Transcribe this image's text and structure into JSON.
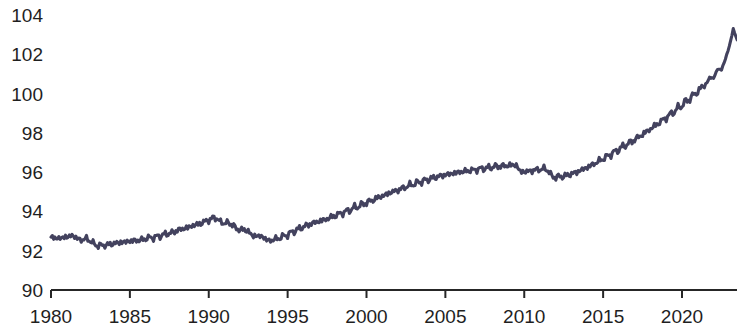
{
  "chart_data": {
    "type": "line",
    "title": "",
    "subtitle": "",
    "xlabel": "",
    "ylabel": "",
    "xlim": [
      1980,
      2023.5
    ],
    "ylim": [
      90,
      104
    ],
    "grid": false,
    "legend": false,
    "legend_position": "none",
    "xticks": [
      1980,
      1985,
      1990,
      1995,
      2000,
      2005,
      2010,
      2015,
      2020
    ],
    "xtick_labels": [
      "1980",
      "1985",
      "1990",
      "1995",
      "2000",
      "2005",
      "2010",
      "2015",
      "2020"
    ],
    "yticks": [
      90,
      92,
      94,
      96,
      98,
      100,
      102,
      104
    ],
    "ytick_labels": [
      "90",
      "92",
      "94",
      "96",
      "98",
      "100",
      "102",
      "104"
    ],
    "line_color": "#43425e",
    "axis_color": "#262626",
    "background_color": "#ffffff",
    "series": [
      {
        "name": "index",
        "x": [
          1980.0,
          1980.25,
          1980.5,
          1980.75,
          1981.0,
          1981.25,
          1981.5,
          1981.75,
          1982.0,
          1982.25,
          1982.5,
          1982.75,
          1983.0,
          1983.25,
          1983.5,
          1983.75,
          1984.0,
          1984.25,
          1984.5,
          1984.75,
          1985.0,
          1985.25,
          1985.5,
          1985.75,
          1986.0,
          1986.25,
          1986.5,
          1986.75,
          1987.0,
          1987.25,
          1987.5,
          1987.75,
          1988.0,
          1988.25,
          1988.5,
          1988.75,
          1989.0,
          1989.25,
          1989.5,
          1989.75,
          1990.0,
          1990.25,
          1990.5,
          1990.75,
          1991.0,
          1991.25,
          1991.5,
          1991.75,
          1992.0,
          1992.25,
          1992.5,
          1992.75,
          1993.0,
          1993.25,
          1993.5,
          1993.75,
          1994.0,
          1994.25,
          1994.5,
          1994.75,
          1995.0,
          1995.25,
          1995.5,
          1995.75,
          1996.0,
          1996.25,
          1996.5,
          1996.75,
          1997.0,
          1997.25,
          1997.5,
          1997.75,
          1998.0,
          1998.25,
          1998.5,
          1998.75,
          1999.0,
          1999.25,
          1999.5,
          1999.75,
          2000.0,
          2000.25,
          2000.5,
          2000.75,
          2001.0,
          2001.25,
          2001.5,
          2001.75,
          2002.0,
          2002.25,
          2002.5,
          2002.75,
          2003.0,
          2003.25,
          2003.5,
          2003.75,
          2004.0,
          2004.25,
          2004.5,
          2004.75,
          2005.0,
          2005.25,
          2005.5,
          2005.75,
          2006.0,
          2006.25,
          2006.5,
          2006.75,
          2007.0,
          2007.25,
          2007.5,
          2007.75,
          2008.0,
          2008.25,
          2008.5,
          2008.75,
          2009.0,
          2009.25,
          2009.5,
          2009.75,
          2010.0,
          2010.25,
          2010.5,
          2010.75,
          2011.0,
          2011.25,
          2011.5,
          2011.75,
          2012.0,
          2012.25,
          2012.5,
          2012.75,
          2013.0,
          2013.25,
          2013.5,
          2013.75,
          2014.0,
          2014.25,
          2014.5,
          2014.75,
          2015.0,
          2015.25,
          2015.5,
          2015.75,
          2016.0,
          2016.25,
          2016.5,
          2016.75,
          2017.0,
          2017.25,
          2017.5,
          2017.75,
          2018.0,
          2018.25,
          2018.5,
          2018.75,
          2019.0,
          2019.25,
          2019.5,
          2019.75,
          2020.0,
          2020.25,
          2020.5,
          2020.75,
          2021.0,
          2021.25,
          2021.5,
          2021.75,
          2022.0,
          2022.25,
          2022.5,
          2022.75,
          2023.0,
          2023.25,
          2023.5
        ],
        "values": [
          92.62,
          92.7,
          92.58,
          92.72,
          92.66,
          92.8,
          92.7,
          92.6,
          92.52,
          92.66,
          92.44,
          92.38,
          92.2,
          92.34,
          92.22,
          92.4,
          92.3,
          92.48,
          92.36,
          92.52,
          92.42,
          92.58,
          92.46,
          92.62,
          92.54,
          92.74,
          92.6,
          92.8,
          92.7,
          92.92,
          92.8,
          93.02,
          92.96,
          93.18,
          93.06,
          93.28,
          93.2,
          93.42,
          93.3,
          93.58,
          93.48,
          93.74,
          93.6,
          93.5,
          93.36,
          93.46,
          93.28,
          93.16,
          93.02,
          93.12,
          92.94,
          92.82,
          92.7,
          92.8,
          92.62,
          92.56,
          92.48,
          92.66,
          92.58,
          92.82,
          92.74,
          93.02,
          92.94,
          93.22,
          93.12,
          93.4,
          93.28,
          93.54,
          93.4,
          93.66,
          93.52,
          93.8,
          93.68,
          93.96,
          93.84,
          94.12,
          94.0,
          94.3,
          94.16,
          94.46,
          94.34,
          94.64,
          94.5,
          94.82,
          94.68,
          94.96,
          94.86,
          95.12,
          95.0,
          95.26,
          95.16,
          95.42,
          95.3,
          95.56,
          95.44,
          95.68,
          95.56,
          95.8,
          95.68,
          95.9,
          95.78,
          95.98,
          95.86,
          96.06,
          95.94,
          96.12,
          96.0,
          96.18,
          96.06,
          96.26,
          96.12,
          96.3,
          96.18,
          96.38,
          96.22,
          96.4,
          96.26,
          96.44,
          96.28,
          96.1,
          95.94,
          96.12,
          96.0,
          96.2,
          96.06,
          96.24,
          96.04,
          95.84,
          95.68,
          95.84,
          95.72,
          95.92,
          95.84,
          96.06,
          95.98,
          96.24,
          96.16,
          96.44,
          96.36,
          96.66,
          96.58,
          96.9,
          96.82,
          97.14,
          97.06,
          97.4,
          97.3,
          97.64,
          97.54,
          97.9,
          97.8,
          98.18,
          98.08,
          98.46,
          98.36,
          98.76,
          98.66,
          99.06,
          98.96,
          99.38,
          99.28,
          99.72,
          99.62,
          100.06,
          99.98,
          100.44,
          100.36,
          100.84,
          100.76,
          101.26,
          101.2,
          101.76,
          102.4,
          103.28,
          102.72
        ]
      }
    ]
  }
}
